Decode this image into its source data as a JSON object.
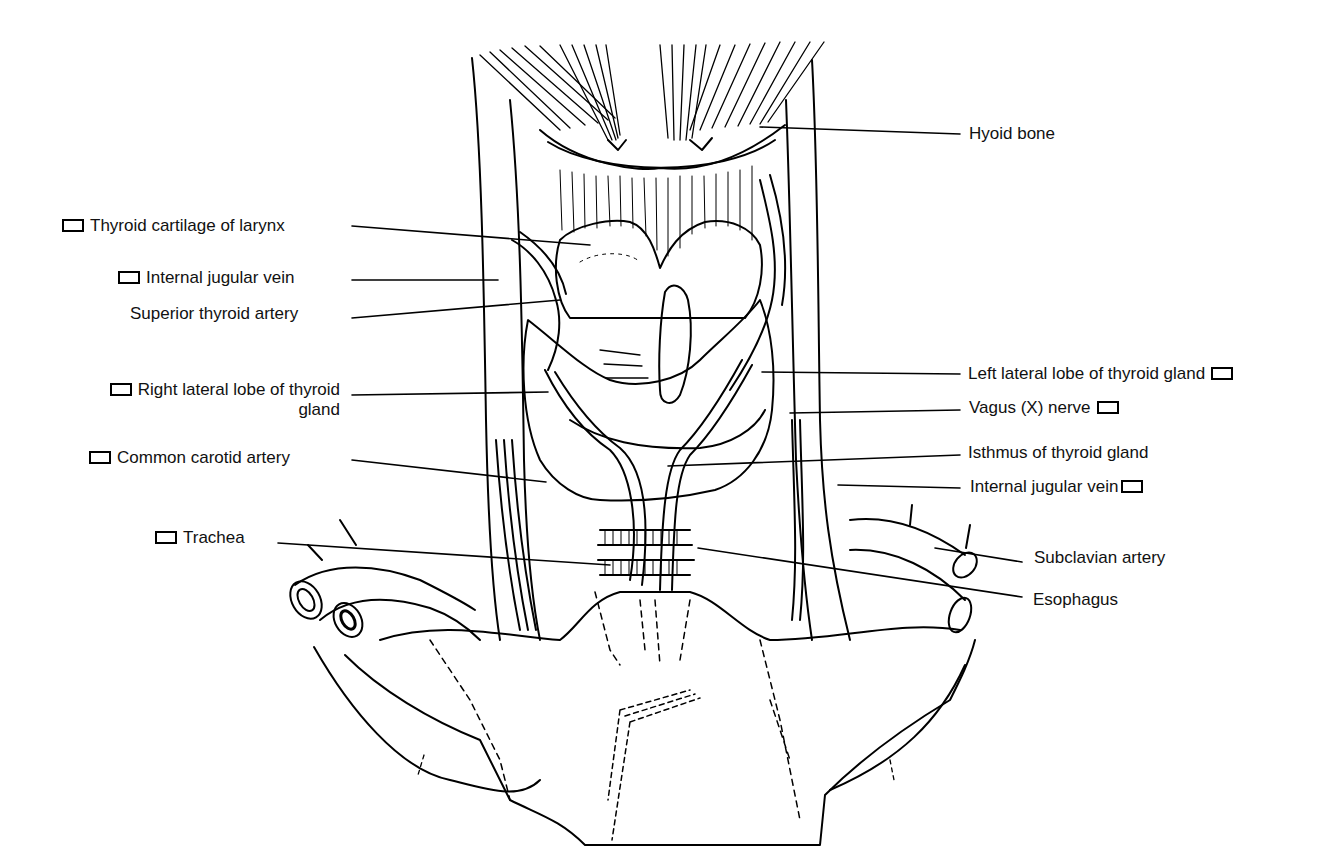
{
  "diagram": {
    "line_color": "#000000",
    "background": "#ffffff"
  },
  "labels": {
    "hyoid_bone": {
      "text": "Hyoid bone",
      "checkbox": false
    },
    "thyroid_cartilage": {
      "text": "Thyroid cartilage of larynx",
      "checkbox": true
    },
    "internal_jugular_vein_right": {
      "text": "Internal jugular vein",
      "checkbox": true
    },
    "superior_thyroid_artery": {
      "text": "Superior thyroid artery",
      "checkbox": false
    },
    "right_lateral_lobe_line1": {
      "text": "Right lateral lobe of thyroid",
      "checkbox": true
    },
    "right_lateral_lobe_line2": {
      "text": "gland"
    },
    "common_carotid_artery": {
      "text": "Common carotid artery",
      "checkbox": true
    },
    "trachea": {
      "text": "Trachea",
      "checkbox": true
    },
    "left_lateral_lobe": {
      "text": "Left lateral lobe of thyroid gland",
      "checkbox": true
    },
    "vagus_nerve": {
      "text": "Vagus (X) nerve",
      "checkbox": true
    },
    "isthmus": {
      "text": "Isthmus of thyroid gland",
      "checkbox": false
    },
    "internal_jugular_vein_left": {
      "text": "Internal jugular vein",
      "checkbox": true
    },
    "subclavian_artery": {
      "text": "Subclavian artery",
      "checkbox": false
    },
    "esophagus": {
      "text": "Esophagus",
      "checkbox": false
    }
  }
}
